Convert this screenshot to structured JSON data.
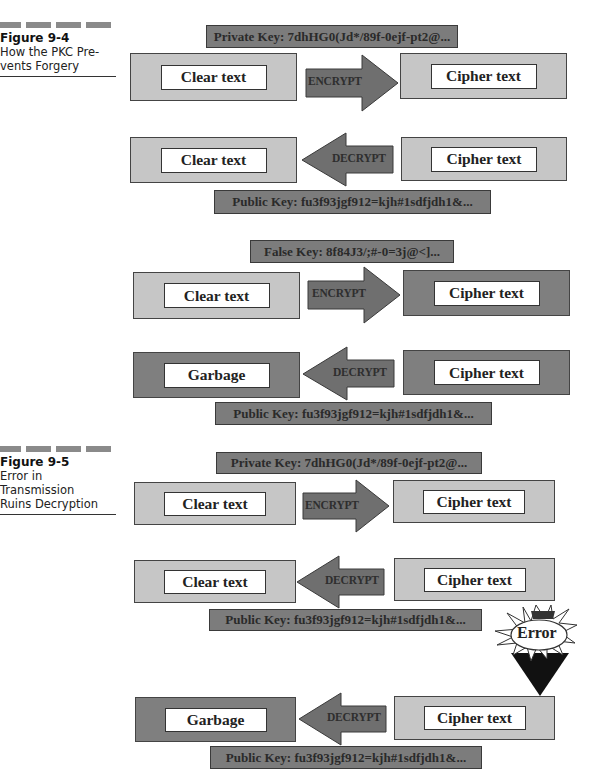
{
  "figures": [
    {
      "number": "Figure 9-4",
      "caption": [
        "How the PKC Pre-",
        "vents Forgery"
      ]
    },
    {
      "number": "Figure 9-5",
      "caption": [
        "Error in Transmission",
        "Ruins Decryption"
      ]
    }
  ],
  "keys": {
    "private": "Private Key: 7dhHG0(Jd*/89f-0ejf-pt2@...",
    "public": "Public Key: fu3f93jgf912=kjh#1sdfjdh1&...",
    "false": "False Key: 8f84J3/;#-0=3j@<]..."
  },
  "labels": {
    "clear_text": "Clear text",
    "cipher_text": "Cipher text",
    "garbage": "Garbage",
    "encrypt": "ENCRYPT",
    "decrypt": "DECRYPT",
    "error": "Error"
  },
  "colors": {
    "light_box": "#c6c6c6",
    "dark_box": "#7f7f7f",
    "key_bar": "#7c7c7c",
    "arrow": "#6f6f6f",
    "border": "#444444"
  },
  "diagram": {
    "figure_9_4": {
      "valid_key_flow": {
        "key_top": "private",
        "encrypt_row": [
          "Clear text",
          "ENCRYPT",
          "Cipher text"
        ],
        "decrypt_row": [
          "Clear text",
          "DECRYPT",
          "Cipher text"
        ],
        "key_bottom": "public"
      },
      "false_key_flow": {
        "key_top": "false",
        "encrypt_row": [
          "Clear text",
          "ENCRYPT",
          "Cipher text"
        ],
        "decrypt_row": [
          "Garbage",
          "DECRYPT",
          "Cipher text"
        ],
        "key_bottom": "public"
      }
    },
    "figure_9_5": {
      "key_top": "private",
      "encrypt_row": [
        "Clear text",
        "ENCRYPT",
        "Cipher text"
      ],
      "decrypt_row": [
        "Clear text",
        "DECRYPT",
        "Cipher text"
      ],
      "key_mid": "public",
      "error_label": "Error",
      "corrupted_decrypt_row": [
        "Garbage",
        "DECRYPT",
        "Cipher text"
      ],
      "key_bottom": "public"
    }
  }
}
